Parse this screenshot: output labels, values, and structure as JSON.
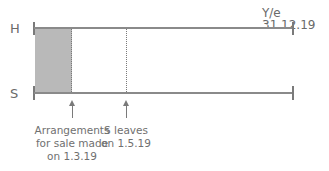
{
  "diagram": {
    "year_end_label": "Y/e 31.12.19",
    "timelines": [
      {
        "label": "H"
      },
      {
        "label": "S"
      }
    ],
    "events": [
      {
        "caption": [
          "Arrangements",
          "for sale made",
          "on 1.3.19"
        ]
      },
      {
        "caption": [
          "S leaves",
          "on 1.5.19"
        ]
      }
    ],
    "colors": {
      "line": "#8a8a8a",
      "shade": "#b9b9b9",
      "text": "#6a6a6a"
    }
  }
}
